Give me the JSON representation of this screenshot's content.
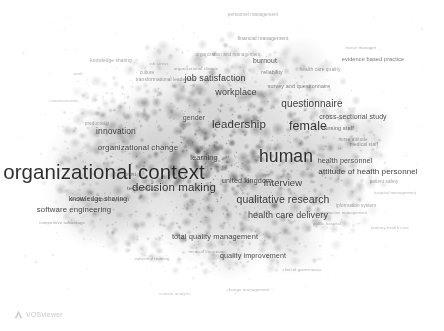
{
  "app": {
    "name": "VOSviewer",
    "logo_label": "VOSviewer",
    "logo_icon": "vosviewer-triangle-icon"
  },
  "canvas": {
    "width": 444,
    "height": 331,
    "background_color": "#ffffff",
    "map_type": "density-visualization",
    "palette": "grayscale",
    "ink_color": "#3c3c3c",
    "label_color": "#1d1d1d"
  },
  "chart_data": {
    "type": "scatter",
    "title": "",
    "xlabel": "",
    "ylabel": "",
    "grid": false,
    "legend": "none",
    "axis_visible": false,
    "xlim": [
      0,
      444
    ],
    "ylim": [
      0,
      331
    ],
    "note": "VOSviewer term density map; weight drives label font size, x/y are pixel positions on the canvas",
    "terms": [
      {
        "label": "organizational context",
        "x": 104,
        "y": 172,
        "weight": 100,
        "size": 20.5,
        "opacity": 0.92
      },
      {
        "label": "human",
        "x": 286,
        "y": 157,
        "weight": 88,
        "size": 17.5,
        "opacity": 0.92
      },
      {
        "label": "female",
        "x": 308,
        "y": 126,
        "weight": 66,
        "size": 12.5,
        "opacity": 0.9
      },
      {
        "label": "leadership",
        "x": 239,
        "y": 125,
        "weight": 64,
        "size": 11.5,
        "opacity": 0.9
      },
      {
        "label": "decision making",
        "x": 174,
        "y": 188,
        "weight": 62,
        "size": 11.5,
        "opacity": 0.9
      },
      {
        "label": "qualitative research",
        "x": 283,
        "y": 199,
        "weight": 58,
        "size": 10.5,
        "opacity": 0.88
      },
      {
        "label": "questionnaire",
        "x": 312,
        "y": 104,
        "weight": 56,
        "size": 10.0,
        "opacity": 0.88
      },
      {
        "label": "interview",
        "x": 283,
        "y": 183,
        "weight": 52,
        "size": 9.5,
        "opacity": 0.88
      },
      {
        "label": "workplace",
        "x": 236,
        "y": 92,
        "weight": 50,
        "size": 9.0,
        "opacity": 0.88
      },
      {
        "label": "job satisfaction",
        "x": 215,
        "y": 78,
        "weight": 50,
        "size": 9.0,
        "opacity": 0.88
      },
      {
        "label": "health care delivery",
        "x": 288,
        "y": 215,
        "weight": 48,
        "size": 9.0,
        "opacity": 0.86
      },
      {
        "label": "attitude of health personnel",
        "x": 368,
        "y": 172,
        "weight": 44,
        "size": 8.0,
        "opacity": 0.86
      },
      {
        "label": "innovation",
        "x": 116,
        "y": 131,
        "weight": 44,
        "size": 8.5,
        "opacity": 0.86
      },
      {
        "label": "organizational change",
        "x": 138,
        "y": 148,
        "weight": 42,
        "size": 8.0,
        "opacity": 0.84
      },
      {
        "label": "software engineering",
        "x": 74,
        "y": 210,
        "weight": 40,
        "size": 7.8,
        "opacity": 0.84
      },
      {
        "label": "total quality management",
        "x": 215,
        "y": 237,
        "weight": 38,
        "size": 7.5,
        "opacity": 0.82
      },
      {
        "label": "united kingdom",
        "x": 247,
        "y": 181,
        "weight": 36,
        "size": 7.2,
        "opacity": 0.82
      },
      {
        "label": "health personnel",
        "x": 345,
        "y": 161,
        "weight": 36,
        "size": 7.2,
        "opacity": 0.82
      },
      {
        "label": "cross-sectional study",
        "x": 353,
        "y": 116,
        "weight": 34,
        "size": 7.0,
        "opacity": 0.8
      },
      {
        "label": "quality improvement",
        "x": 253,
        "y": 256,
        "weight": 34,
        "size": 7.2,
        "opacity": 0.8
      },
      {
        "label": "knowledge sharing",
        "x": 98,
        "y": 199,
        "weight": 32,
        "size": 6.8,
        "opacity": 0.78
      },
      {
        "label": "learning",
        "x": 204,
        "y": 158,
        "weight": 32,
        "size": 7.5,
        "opacity": 0.8
      },
      {
        "label": "gender",
        "x": 194,
        "y": 117,
        "weight": 30,
        "size": 7.0,
        "opacity": 0.78
      },
      {
        "label": "burnout",
        "x": 265,
        "y": 61,
        "weight": 30,
        "size": 6.8,
        "opacity": 0.78
      },
      {
        "label": "evidence based practice",
        "x": 373,
        "y": 60,
        "weight": 28,
        "size": 5.6,
        "opacity": 0.62
      },
      {
        "label": "survey and questionnaire",
        "x": 299,
        "y": 87,
        "weight": 28,
        "size": 5.4,
        "opacity": 0.58
      },
      {
        "label": "technology",
        "x": 142,
        "y": 188,
        "weight": 28,
        "size": 6.0,
        "opacity": 0.7
      },
      {
        "label": "nursing staff",
        "x": 338,
        "y": 129,
        "weight": 26,
        "size": 5.6,
        "opacity": 0.66
      },
      {
        "label": "decision support system",
        "x": 99,
        "y": 200,
        "weight": 24,
        "size": 5.4,
        "opacity": 0.62
      },
      {
        "label": "knowledge sharing",
        "x": 111,
        "y": 61,
        "weight": 22,
        "size": 4.8,
        "opacity": 0.42
      },
      {
        "label": "personnel management",
        "x": 253,
        "y": 15,
        "weight": 22,
        "size": 4.6,
        "opacity": 0.38
      },
      {
        "label": "financial management",
        "x": 263,
        "y": 38,
        "weight": 22,
        "size": 5.0,
        "opacity": 0.48
      },
      {
        "label": "reliability",
        "x": 272,
        "y": 73,
        "weight": 22,
        "size": 5.2,
        "opacity": 0.56
      },
      {
        "label": "health care quality",
        "x": 320,
        "y": 70,
        "weight": 20,
        "size": 4.8,
        "opacity": 0.46
      },
      {
        "label": "medical staff",
        "x": 364,
        "y": 145,
        "weight": 20,
        "size": 4.8,
        "opacity": 0.5
      },
      {
        "label": "nurse attitude",
        "x": 353,
        "y": 140,
        "weight": 20,
        "size": 4.6,
        "opacity": 0.46
      },
      {
        "label": "organization and management",
        "x": 228,
        "y": 55,
        "weight": 20,
        "size": 4.6,
        "opacity": 0.4
      },
      {
        "label": "transformational leadership",
        "x": 166,
        "y": 80,
        "weight": 20,
        "size": 4.8,
        "opacity": 0.46
      },
      {
        "label": "culture",
        "x": 147,
        "y": 73,
        "weight": 18,
        "size": 4.6,
        "opacity": 0.44
      },
      {
        "label": "productivity",
        "x": 97,
        "y": 124,
        "weight": 18,
        "size": 4.6,
        "opacity": 0.44
      },
      {
        "label": "competitive advantage",
        "x": 62,
        "y": 223,
        "weight": 18,
        "size": 4.4,
        "opacity": 0.42
      },
      {
        "label": "trust",
        "x": 131,
        "y": 175,
        "weight": 18,
        "size": 5.2,
        "opacity": 0.56
      },
      {
        "label": "patient safety",
        "x": 384,
        "y": 182,
        "weight": 18,
        "size": 4.6,
        "opacity": 0.44
      },
      {
        "label": "information system",
        "x": 356,
        "y": 206,
        "weight": 18,
        "size": 4.6,
        "opacity": 0.44
      },
      {
        "label": "clinical governance",
        "x": 302,
        "y": 270,
        "weight": 16,
        "size": 4.4,
        "opacity": 0.36
      },
      {
        "label": "change management",
        "x": 248,
        "y": 290,
        "weight": 16,
        "size": 4.4,
        "opacity": 0.34
      },
      {
        "label": "industrial training",
        "x": 152,
        "y": 259,
        "weight": 16,
        "size": 4.4,
        "opacity": 0.38
      },
      {
        "label": "medical literature",
        "x": 206,
        "y": 252,
        "weight": 16,
        "size": 4.4,
        "opacity": 0.38
      },
      {
        "label": "content analysis",
        "x": 175,
        "y": 294,
        "weight": 14,
        "size": 4.2,
        "opacity": 0.3
      },
      {
        "label": "communication",
        "x": 64,
        "y": 101,
        "weight": 14,
        "size": 4.2,
        "opacity": 0.3
      },
      {
        "label": "work",
        "x": 78,
        "y": 74,
        "weight": 14,
        "size": 4.2,
        "opacity": 0.32
      },
      {
        "label": "nurse manager",
        "x": 361,
        "y": 48,
        "weight": 14,
        "size": 4.4,
        "opacity": 0.38
      },
      {
        "label": "job stress",
        "x": 159,
        "y": 64,
        "weight": 14,
        "size": 4.2,
        "opacity": 0.34
      },
      {
        "label": "organizational climate",
        "x": 196,
        "y": 69,
        "weight": 14,
        "size": 4.4,
        "opacity": 0.4
      },
      {
        "label": "information management",
        "x": 343,
        "y": 213,
        "weight": 14,
        "size": 4.2,
        "opacity": 0.36
      },
      {
        "label": "hospital management",
        "x": 395,
        "y": 193,
        "weight": 14,
        "size": 4.2,
        "opacity": 0.34
      },
      {
        "label": "primary health care",
        "x": 390,
        "y": 228,
        "weight": 14,
        "size": 4.2,
        "opacity": 0.32
      },
      {
        "label": "public hospital",
        "x": 327,
        "y": 224,
        "weight": 14,
        "size": 4.2,
        "opacity": 0.36
      }
    ]
  }
}
